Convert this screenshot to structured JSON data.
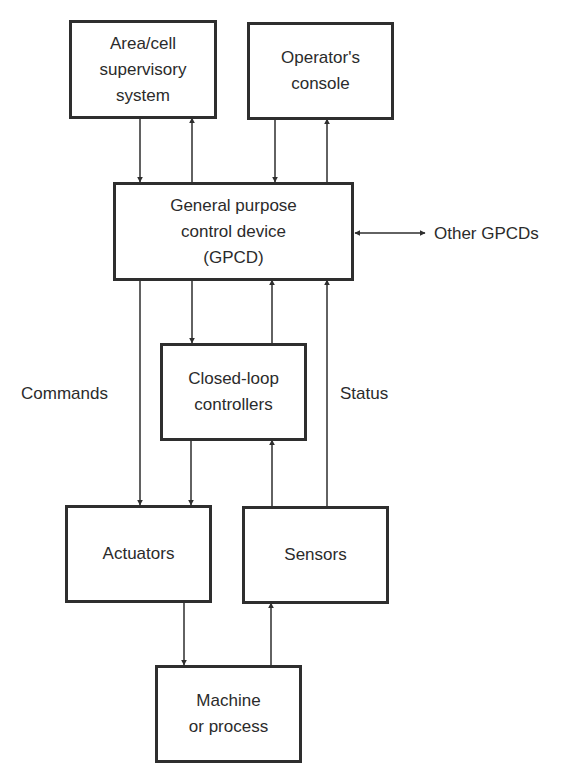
{
  "diagram": {
    "nodes": [
      {
        "id": "area",
        "label": "Area/cell\nsupervisory\nsystem"
      },
      {
        "id": "operator",
        "label": "Operator's\nconsole"
      },
      {
        "id": "gpcd",
        "label": "General purpose\ncontrol device\n(GPCD)"
      },
      {
        "id": "closed_loop",
        "label": "Closed-loop\ncontrollers"
      },
      {
        "id": "actuators",
        "label": "Actuators"
      },
      {
        "id": "sensors",
        "label": "Sensors"
      },
      {
        "id": "machine",
        "label": "Machine\nor process"
      }
    ],
    "labels": {
      "other_gpcds": "Other GPCDs",
      "commands": "Commands",
      "status": "Status"
    },
    "edges": [
      {
        "from": "area",
        "to": "gpcd"
      },
      {
        "from": "gpcd",
        "to": "area"
      },
      {
        "from": "operator",
        "to": "gpcd"
      },
      {
        "from": "gpcd",
        "to": "operator"
      },
      {
        "from": "gpcd",
        "to": "other_gpcds",
        "bidirectional": true
      },
      {
        "from": "gpcd",
        "to": "actuators",
        "label": "Commands"
      },
      {
        "from": "gpcd",
        "to": "closed_loop"
      },
      {
        "from": "closed_loop",
        "to": "gpcd"
      },
      {
        "from": "sensors",
        "to": "gpcd",
        "label": "Status"
      },
      {
        "from": "closed_loop",
        "to": "actuators"
      },
      {
        "from": "sensors",
        "to": "closed_loop"
      },
      {
        "from": "actuators",
        "to": "machine"
      },
      {
        "from": "machine",
        "to": "sensors"
      }
    ],
    "colors": {
      "stroke": "#2e2e2e",
      "text": "#2b2b2b",
      "background": "#ffffff"
    }
  }
}
